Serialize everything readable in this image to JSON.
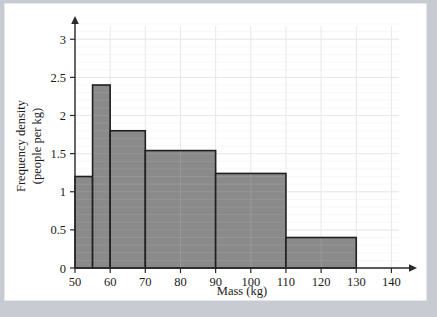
{
  "figure": {
    "background_color": "#ffffff",
    "page_margin_color": "#c8cbd1",
    "bar_fill_color": "#8a8a8a",
    "bar_edge_color": "#1f1f1f",
    "grid_color": "#e6e8ec"
  },
  "chart_data": {
    "type": "bar",
    "title": "",
    "xlabel": "Mass (kg)",
    "ylabel": "Frequency density (people per kg)",
    "ylabel_line1": "Frequency density",
    "ylabel_line2": "(people per kg)",
    "xlim": [
      50,
      145
    ],
    "ylim": [
      0,
      3.2
    ],
    "grid": true,
    "legend": "none",
    "xticks": [
      50,
      60,
      70,
      80,
      90,
      100,
      110,
      120,
      130,
      140
    ],
    "xtick_labels": [
      "50",
      "60",
      "70",
      "80",
      "90",
      "100",
      "110",
      "120",
      "130",
      "140"
    ],
    "yticks": [
      0,
      0.5,
      1,
      1.5,
      2,
      2.5,
      3
    ],
    "ytick_labels": [
      "0",
      "0.5",
      "1",
      "1.5",
      "2",
      "2.5",
      "3"
    ],
    "bins": [
      {
        "label": "50-55",
        "x_start": 50,
        "x_end": 55,
        "density": 1.2
      },
      {
        "label": "55-60",
        "x_start": 55,
        "x_end": 60,
        "density": 2.4
      },
      {
        "label": "60-70",
        "x_start": 60,
        "x_end": 70,
        "density": 1.8
      },
      {
        "label": "70-90",
        "x_start": 70,
        "x_end": 90,
        "density": 1.54
      },
      {
        "label": "90-110",
        "x_start": 90,
        "x_end": 110,
        "density": 1.24
      },
      {
        "label": "110-130",
        "x_start": 110,
        "x_end": 130,
        "density": 0.4
      }
    ]
  }
}
